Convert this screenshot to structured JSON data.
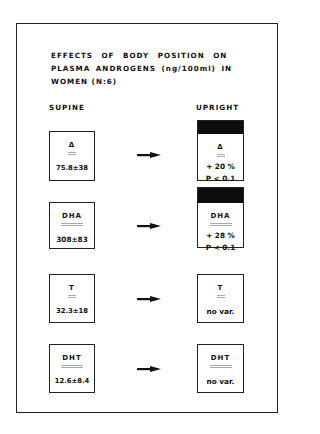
{
  "title": "EFFECTS OF BODY POSITION ON PLASMA ANDROGENS (ng/100ml) IN WOMEN (N:6)",
  "title_lines": [
    "EFFECTS OF BODY POSITION ON",
    "PLASMA ANDROGENS (ng/100ml) IN",
    "WOMEN (N:6)"
  ],
  "columns": {
    "left": "SUPINE",
    "right": "UPRIGHT"
  },
  "rows": [
    {
      "hormone": "Δ",
      "supine": "75.8±38",
      "upright_change": "+ 20 %",
      "upright_p": "P < 0.1",
      "upright_highlight": true
    },
    {
      "hormone": "DHA",
      "supine": "308±83",
      "upright_change": "+ 28 %",
      "upright_p": "P < 0.1",
      "upright_highlight": true
    },
    {
      "hormone": "T",
      "supine": "32.3±18",
      "upright_change": "no var.",
      "upright_p": "",
      "upright_highlight": false
    },
    {
      "hormone": "DHT",
      "supine": "12.6±8.4",
      "upright_change": "no var.",
      "upright_p": "",
      "upright_highlight": false
    }
  ],
  "arrow_icon": "right-arrow-icon"
}
